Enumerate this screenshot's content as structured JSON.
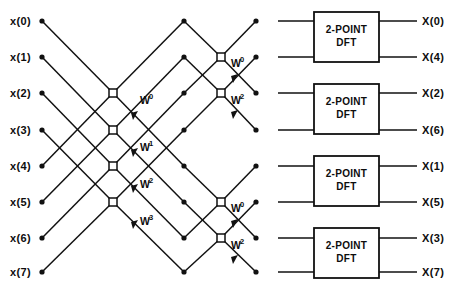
{
  "diagram": {
    "title_kind": "fft-signal-flow-graph",
    "inputs": [
      {
        "label": "x(0)",
        "y": 21
      },
      {
        "label": "x(1)",
        "y": 57
      },
      {
        "label": "x(2)",
        "y": 93
      },
      {
        "label": "x(3)",
        "y": 130
      },
      {
        "label": "x(4)",
        "y": 166
      },
      {
        "label": "x(5)",
        "y": 202
      },
      {
        "label": "x(6)",
        "y": 238
      },
      {
        "label": "x(7)",
        "y": 272
      }
    ],
    "outputs": [
      {
        "label": "X(0)",
        "y": 21
      },
      {
        "label": "X(4)",
        "y": 57
      },
      {
        "label": "X(2)",
        "y": 93
      },
      {
        "label": "X(6)",
        "y": 130
      },
      {
        "label": "X(1)",
        "y": 166
      },
      {
        "label": "X(5)",
        "y": 202
      },
      {
        "label": "X(3)",
        "y": 238
      },
      {
        "label": "X(7)",
        "y": 272
      }
    ],
    "twiddles_stage1": [
      {
        "base": "W",
        "exp": "0",
        "x": 140,
        "y": 104
      },
      {
        "base": "W",
        "exp": "1",
        "x": 140,
        "y": 151
      },
      {
        "base": "W",
        "exp": "2",
        "x": 140,
        "y": 188
      },
      {
        "base": "W",
        "exp": "3",
        "x": 140,
        "y": 225
      }
    ],
    "twiddles_stage2": [
      {
        "base": "W",
        "exp": "0",
        "x": 231,
        "y": 67
      },
      {
        "base": "W",
        "exp": "2",
        "x": 231,
        "y": 104
      },
      {
        "base": "W",
        "exp": "0",
        "x": 231,
        "y": 212
      },
      {
        "base": "W",
        "exp": "2",
        "x": 231,
        "y": 249
      }
    ],
    "dft_boxes": [
      {
        "line1": "2-POINT",
        "line2": "DFT",
        "x": 314,
        "y": 12,
        "w": 65,
        "h": 50
      },
      {
        "line1": "2-POINT",
        "line2": "DFT",
        "x": 314,
        "y": 84,
        "w": 65,
        "h": 50
      },
      {
        "line1": "2-POINT",
        "line2": "DFT",
        "x": 314,
        "y": 156,
        "w": 65,
        "h": 50
      },
      {
        "line1": "2-POINT",
        "line2": "DFT",
        "x": 314,
        "y": 228,
        "w": 65,
        "h": 50
      }
    ],
    "colors": {
      "ink": "#111111",
      "paper": "#ffffff"
    }
  }
}
